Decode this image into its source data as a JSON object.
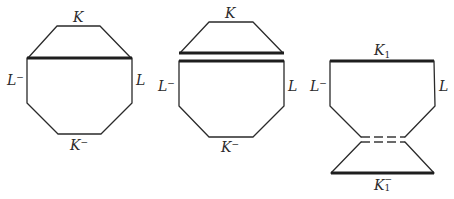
{
  "figures": [
    {
      "id": "octagon-with-chord",
      "labels": {
        "top": "K",
        "left": "L",
        "left_sup": "−",
        "right": "L",
        "bottom": "K",
        "bottom_sup": "−"
      }
    },
    {
      "id": "octagon-cut-along-chord",
      "labels": {
        "top": "K",
        "left": "L",
        "left_sup": "−",
        "right": "L",
        "bottom": "K",
        "bottom_sup": "−"
      }
    },
    {
      "id": "surgery-result",
      "labels": {
        "top": "K",
        "top_sub": "1",
        "left": "L",
        "left_sup": "−",
        "right": "L",
        "bottom": "K",
        "bottom_sub": "1",
        "bottom_sup": "−"
      }
    }
  ],
  "colors": {
    "line": "#2a2a2a",
    "background": "#ffffff"
  }
}
